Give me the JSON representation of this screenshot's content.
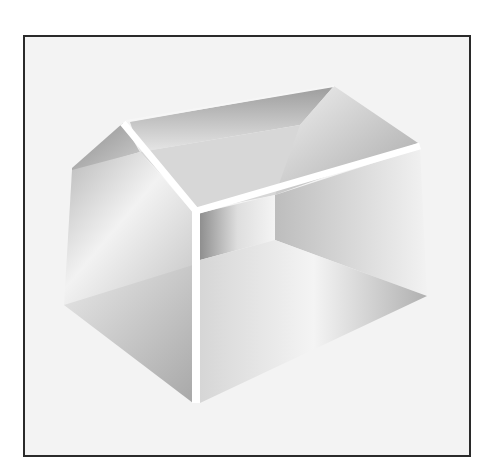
{
  "illustration": {
    "subject": "open house-shaped box",
    "style": "grayscale airbrushed 3D rendering",
    "colors": {
      "frame_border": "#2a2a2a",
      "background": "#f3f3f3",
      "edge_highlight": "#ffffff",
      "dark_shade": "#9a9a9a"
    }
  }
}
